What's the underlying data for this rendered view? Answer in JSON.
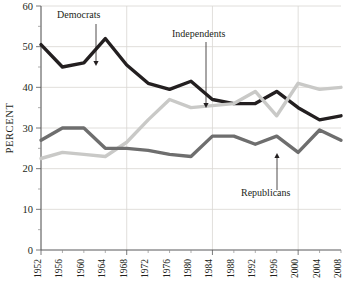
{
  "chart_data": {
    "type": "line",
    "title": "",
    "xlabel": "",
    "ylabel": "PERCENT",
    "xlim": [
      1952,
      2008
    ],
    "ylim": [
      0,
      60
    ],
    "ytick_step": 10,
    "grid": true,
    "legend_position": "inline-annotations",
    "categories": [
      1952,
      1956,
      1960,
      1964,
      1968,
      1972,
      1976,
      1980,
      1984,
      1988,
      1992,
      1996,
      2000,
      2004,
      2008
    ],
    "x_tick_labels": [
      "1952",
      "1956",
      "1960",
      "1964",
      "1968",
      "1972",
      "1976",
      "1980",
      "1984",
      "1988",
      "1992",
      "1996",
      "2000",
      "2004",
      "2008"
    ],
    "y_tick_labels": [
      "0",
      "10",
      "20",
      "30",
      "40",
      "50",
      "60"
    ],
    "y_tick_values": [
      0,
      10,
      20,
      30,
      40,
      50,
      60
    ],
    "series": [
      {
        "name": "Democrats",
        "color": "#231f20",
        "stroke_width": 3.4,
        "values": [
          50.5,
          45.0,
          46.0,
          52.0,
          45.5,
          41.0,
          39.5,
          41.5,
          37.0,
          36.0,
          36.0,
          39.0,
          35.0,
          32.0,
          33.0
        ]
      },
      {
        "name": "Independents",
        "color": "#c9c9c7",
        "stroke_width": 3.4,
        "values": [
          22.5,
          24.0,
          23.5,
          23.0,
          26.5,
          32.0,
          37.0,
          35.0,
          35.5,
          36.0,
          39.0,
          33.0,
          41.0,
          39.5,
          40.0
        ]
      },
      {
        "name": "Republicans",
        "color": "#6e6e6e",
        "stroke_width": 3.4,
        "values": [
          27.0,
          30.0,
          30.0,
          25.0,
          25.0,
          24.5,
          23.5,
          23.0,
          28.0,
          28.0,
          26.0,
          28.0,
          24.0,
          29.5,
          27.0
        ]
      }
    ],
    "annotations": [
      {
        "label": "Democrats",
        "label_x": 57,
        "label_y": 18,
        "arrow_x": 96,
        "arrow_from_y": 24,
        "arrow_to_y": 66
      },
      {
        "label": "Independents",
        "label_x": 172,
        "label_y": 37,
        "arrow_x": 206,
        "arrow_from_y": 42,
        "arrow_to_y": 108
      },
      {
        "label": "Republicans",
        "label_x": 241,
        "label_y": 196,
        "arrow_x": 277,
        "arrow_from_y": 190,
        "arrow_to_y": 153
      }
    ]
  }
}
